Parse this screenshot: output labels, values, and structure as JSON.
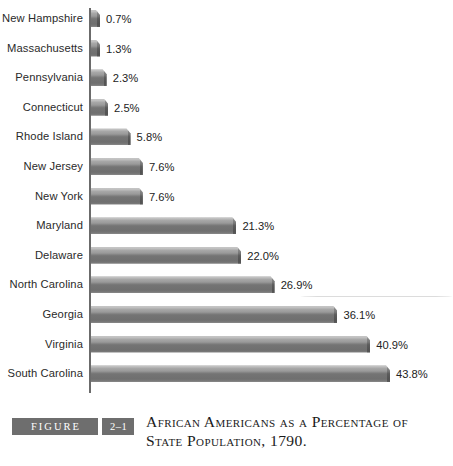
{
  "figure": {
    "label_word": "FIGURE",
    "number": "2–1",
    "caption_line1": "African Americans as a Percentage of",
    "caption_line2": "State Population, 1790.",
    "box_color": "#6e6e6e",
    "box_text_color": "#ffffff"
  },
  "chart_data": {
    "type": "bar",
    "orientation": "horizontal",
    "title": "African Americans as a Percentage of State Population, 1790.",
    "xlabel": "",
    "ylabel": "",
    "xlim": [
      0,
      43.8
    ],
    "grid": false,
    "legend": null,
    "value_suffix": "%",
    "categories": [
      "New Hampshire",
      "Massachusetts",
      "Pennsylvania",
      "Connecticut",
      "Rhode Island",
      "New Jersey",
      "New York",
      "Maryland",
      "Delaware",
      "North Carolina",
      "Georgia",
      "Virginia",
      "South Carolina"
    ],
    "values": [
      0.7,
      1.3,
      2.3,
      2.5,
      5.8,
      7.6,
      7.6,
      21.3,
      22.0,
      26.9,
      36.1,
      40.9,
      43.8
    ],
    "value_labels": [
      "0.7%",
      "1.3%",
      "2.3%",
      "2.5%",
      "5.8%",
      "7.6%",
      "7.6%",
      "21.3%",
      "22.0%",
      "26.9%",
      "36.1%",
      "40.9%",
      "43.8%"
    ],
    "bar_color_top": "#c6c6c6",
    "bar_color_mid": "#8d8d8d",
    "bar_color_bottom": "#6f6f6f",
    "axis_color": "#6b6b6b"
  }
}
